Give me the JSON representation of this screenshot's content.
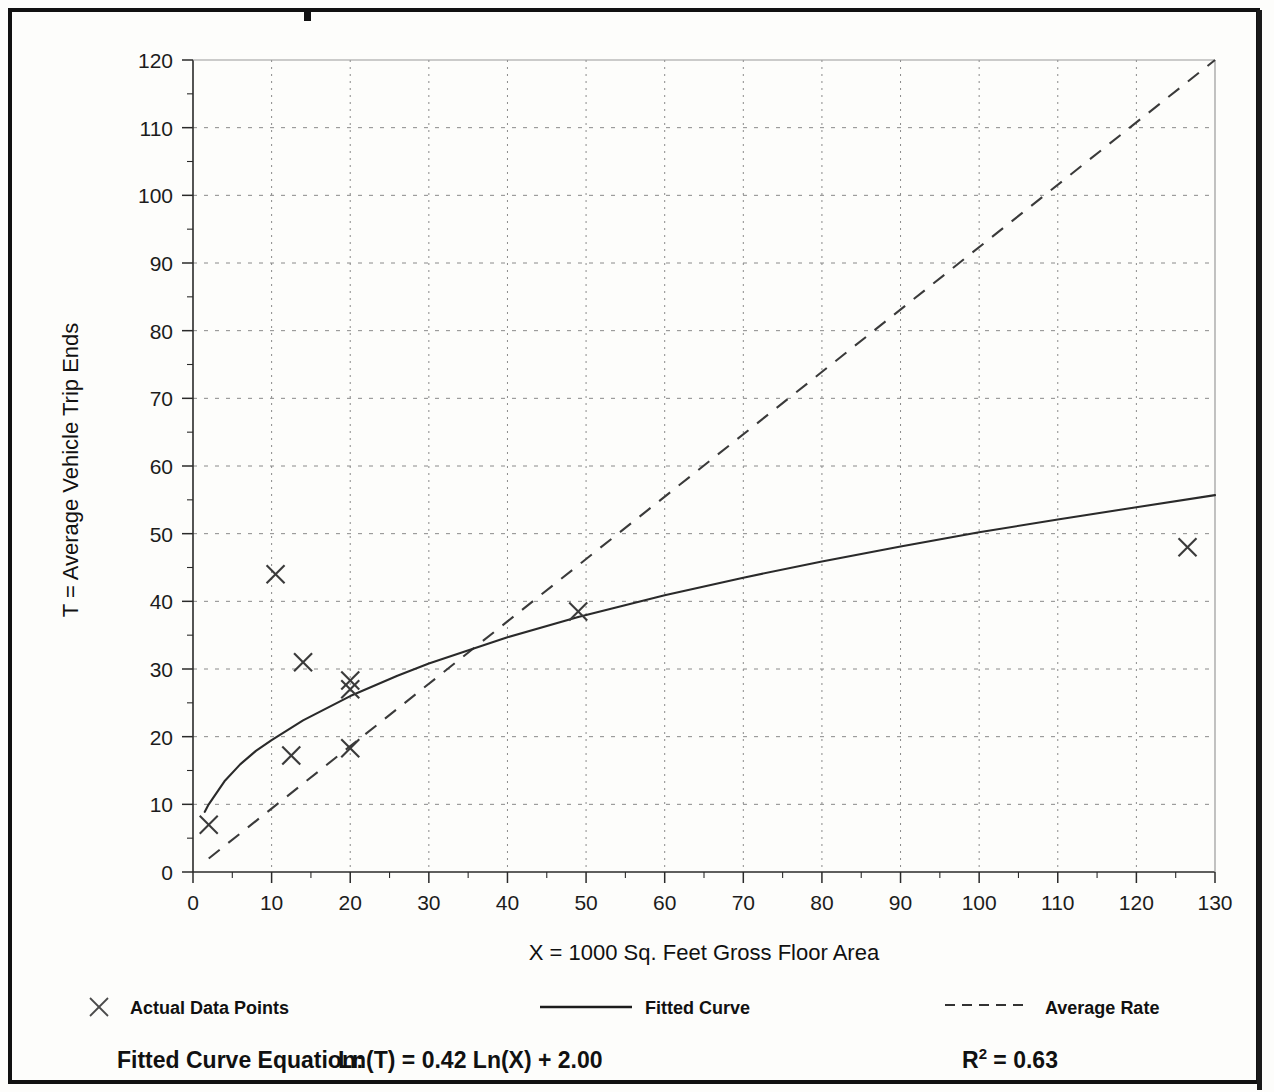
{
  "figure": {
    "background": "#fdfdfb",
    "border_color": "#111111"
  },
  "axes": {
    "x_title": "X = 1000 Sq. Feet Gross Floor Area",
    "y_title": "T = Average Vehicle Trip Ends",
    "x_ticks": [
      "0",
      "10",
      "20",
      "30",
      "40",
      "50",
      "60",
      "70",
      "80",
      "90",
      "100",
      "110",
      "120",
      "130"
    ],
    "y_ticks": [
      "0",
      "10",
      "20",
      "30",
      "40",
      "50",
      "60",
      "70",
      "80",
      "90",
      "100",
      "110",
      "120"
    ]
  },
  "legend": {
    "items": [
      {
        "key": "actual-data-points",
        "label": "Actual Data Points",
        "marker": "x-marker",
        "color": "#3a3a3a"
      },
      {
        "key": "fitted-curve",
        "label": "Fitted Curve",
        "marker": "solid-line",
        "color": "#2a2a2a"
      },
      {
        "key": "average-rate",
        "label": "Average Rate",
        "marker": "dashed-line",
        "color": "#3a3a3a"
      }
    ]
  },
  "footer": {
    "equation_label": "Fitted Curve Equation:",
    "equation": "Ln(T) = 0.42 Ln(X) + 2.00",
    "r_squared_base": "R",
    "r_squared_exp": "2",
    "r_squared_value": "= 0.63"
  },
  "chart_data": {
    "type": "scatter",
    "title": "",
    "xlabel": "X = 1000 Sq. Feet Gross Floor Area",
    "ylabel": "T = Average Vehicle Trip Ends",
    "xlim": [
      0,
      130
    ],
    "ylim": [
      0,
      120
    ],
    "x_major_step": 10,
    "x_minor_step": 5,
    "y_major_step": 10,
    "y_minor_step": 5,
    "grid": true,
    "grid_style": "dotted",
    "legend_position": "below-axes",
    "series": [
      {
        "name": "Actual Data Points",
        "type": "scatter",
        "marker": "x",
        "points": [
          {
            "x": 2.0,
            "y": 7.0
          },
          {
            "x": 10.5,
            "y": 44.0
          },
          {
            "x": 12.5,
            "y": 17.2
          },
          {
            "x": 14.0,
            "y": 31.0
          },
          {
            "x": 20.0,
            "y": 28.3
          },
          {
            "x": 20.0,
            "y": 27.0
          },
          {
            "x": 20.0,
            "y": 18.3
          },
          {
            "x": 49.0,
            "y": 38.5
          },
          {
            "x": 126.5,
            "y": 48.0
          }
        ]
      },
      {
        "name": "Fitted Curve",
        "type": "line",
        "style": "solid",
        "equation": "Ln(T) = 0.42 Ln(X) + 2.00",
        "r_squared": 0.63,
        "coefficients": {
          "slope": 0.42,
          "intercept": 2.0
        },
        "x_range": [
          1.5,
          130
        ],
        "points": [
          {
            "x": 1.5,
            "y": 8.9
          },
          {
            "x": 2,
            "y": 10.0
          },
          {
            "x": 4,
            "y": 13.4
          },
          {
            "x": 6,
            "y": 15.9
          },
          {
            "x": 8,
            "y": 17.9
          },
          {
            "x": 10,
            "y": 19.5
          },
          {
            "x": 14,
            "y": 22.4
          },
          {
            "x": 20,
            "y": 26.0
          },
          {
            "x": 26,
            "y": 29.0
          },
          {
            "x": 30,
            "y": 30.8
          },
          {
            "x": 40,
            "y": 34.7
          },
          {
            "x": 49,
            "y": 37.7
          },
          {
            "x": 60,
            "y": 40.9
          },
          {
            "x": 70,
            "y": 43.5
          },
          {
            "x": 80,
            "y": 45.9
          },
          {
            "x": 90,
            "y": 48.1
          },
          {
            "x": 100,
            "y": 50.2
          },
          {
            "x": 110,
            "y": 52.1
          },
          {
            "x": 120,
            "y": 53.9
          },
          {
            "x": 130,
            "y": 55.7
          }
        ]
      },
      {
        "name": "Average Rate",
        "type": "line",
        "style": "dashed",
        "slope": 0.92,
        "points": [
          {
            "x": 2.0,
            "y": 2.0
          },
          {
            "x": 130.0,
            "y": 120.0
          }
        ]
      }
    ]
  }
}
